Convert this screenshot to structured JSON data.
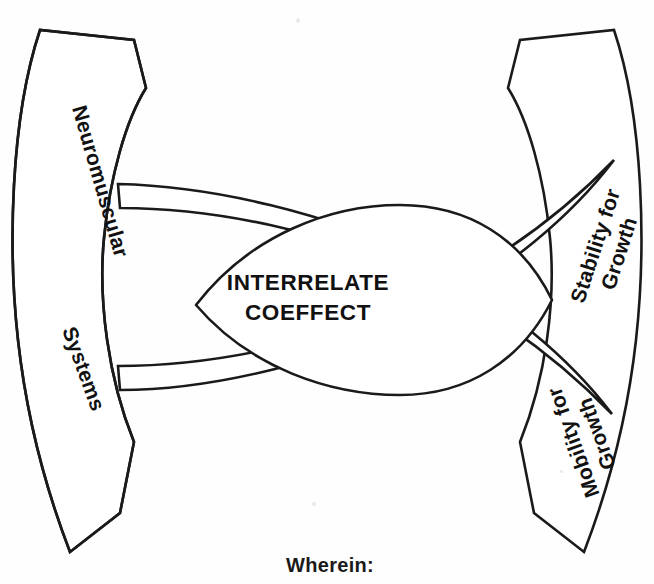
{
  "figure": {
    "title_text": "INTERRELATE COEFFECT",
    "background_color": "#ffffff",
    "line_color": "#1a1a1a",
    "text_color": "#111111"
  },
  "center": {
    "line1": "INTERRELATE",
    "line2": "COEFFECT"
  },
  "ribbons": [
    {
      "id": "upper-left",
      "label": "Neuromuscular",
      "position": "top-left"
    },
    {
      "id": "lower-left",
      "label": "Systems",
      "position": "bottom-left"
    },
    {
      "id": "upper-right",
      "label_line1": "Stability for",
      "label_line2": "Growth",
      "position": "top-right"
    },
    {
      "id": "lower-right",
      "label_line1": "Mobility for",
      "label_line2": "Growth",
      "position": "bottom-right"
    }
  ],
  "footer": {
    "text": "Wherein:"
  }
}
